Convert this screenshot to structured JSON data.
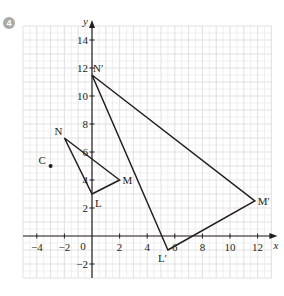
{
  "question": {
    "number": "4"
  },
  "chart_data": {
    "type": "diagram",
    "title": "",
    "xlabel": "x",
    "ylabel": "y",
    "xlim": [
      -5,
      13
    ],
    "ylim": [
      -3,
      15
    ],
    "grid": true,
    "x_ticks": [
      -4,
      -2,
      2,
      4,
      6,
      8,
      10,
      12
    ],
    "y_ticks": [
      -2,
      2,
      4,
      6,
      8,
      10,
      12,
      14
    ],
    "origin_label": "0",
    "points": [
      {
        "name": "C",
        "x": -3,
        "y": 5
      }
    ],
    "shapes": [
      {
        "name": "triangle LMN",
        "vertices": [
          {
            "label": "L",
            "x": 0,
            "y": 3
          },
          {
            "label": "M",
            "x": 2,
            "y": 4
          },
          {
            "label": "N",
            "x": -2,
            "y": 7
          }
        ]
      },
      {
        "name": "triangle L'M'N'",
        "vertices": [
          {
            "label": "L′",
            "x": 5.5,
            "y": -1
          },
          {
            "label": "M′",
            "x": 11.8,
            "y": 2.5
          },
          {
            "label": "N′",
            "x": 0,
            "y": 11.5
          }
        ]
      }
    ]
  },
  "colors": {
    "grid": "#d9d9d9",
    "axis": "#231f20",
    "badge": "#a9a9a9"
  }
}
